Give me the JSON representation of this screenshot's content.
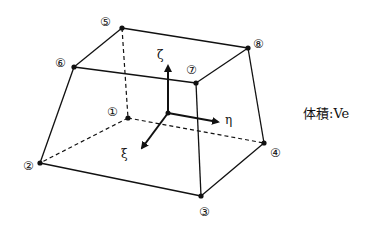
{
  "diagram": {
    "nodes": [
      {
        "id": "1",
        "label": "①",
        "x": 128,
        "y": 118
      },
      {
        "id": "2",
        "label": "②",
        "x": 40,
        "y": 163
      },
      {
        "id": "3",
        "label": "③",
        "x": 201,
        "y": 196
      },
      {
        "id": "4",
        "label": "④",
        "x": 264,
        "y": 143
      },
      {
        "id": "5",
        "label": "⑤",
        "x": 122,
        "y": 28
      },
      {
        "id": "6",
        "label": "⑥",
        "x": 74,
        "y": 67
      },
      {
        "id": "7",
        "label": "⑦",
        "x": 196,
        "y": 83
      },
      {
        "id": "8",
        "label": "⑧",
        "x": 248,
        "y": 48
      }
    ],
    "axes": {
      "zeta": "ζ",
      "eta": "η",
      "xi": "ξ"
    },
    "volume_label": "体積:Ve",
    "colors": {
      "line": "#111111",
      "background": "#ffffff"
    }
  }
}
